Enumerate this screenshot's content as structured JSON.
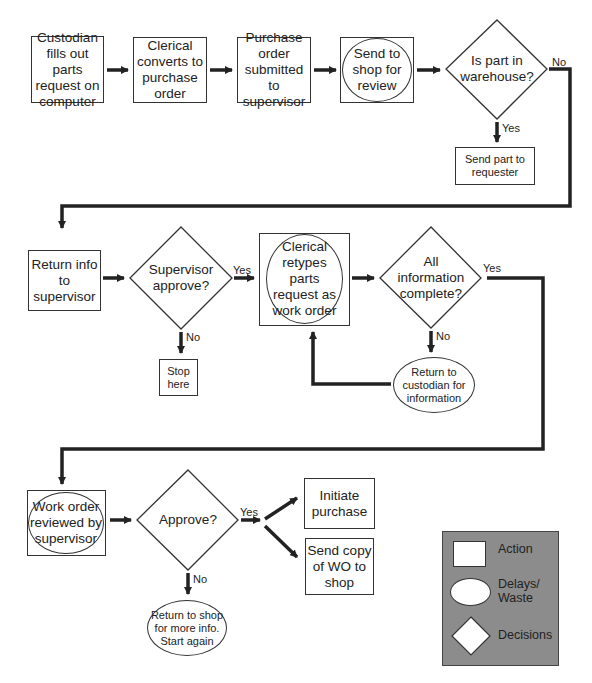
{
  "diagram": {
    "type": "flowchart",
    "nodes": {
      "custodian_fills": {
        "shape": "action",
        "label": "Custodian\nfills out parts\nrequest on\ncomputer"
      },
      "clerical_converts": {
        "shape": "action",
        "label": "Clerical\nconverts to\npurchase\norder"
      },
      "po_submitted": {
        "shape": "action",
        "label": "Purchase\norder\nsubmitted to\nsupervisor"
      },
      "send_to_shop": {
        "shape": "action-delay",
        "label": "Send to\nshop for\nreview"
      },
      "is_part_in_warehouse": {
        "shape": "decision",
        "label": "Is part in\nwarehouse?"
      },
      "send_part": {
        "shape": "action",
        "label": "Send part to\nrequester"
      },
      "return_info": {
        "shape": "action",
        "label": "Return info\nto\nsupervisor"
      },
      "supervisor_approve": {
        "shape": "decision",
        "label": "Supervisor\napprove?"
      },
      "stop_here": {
        "shape": "action",
        "label": "Stop\nhere"
      },
      "clerical_retypes": {
        "shape": "action-delay",
        "label": "Clerical\nretypes\nparts\nrequest as\nwork order"
      },
      "all_info_complete": {
        "shape": "decision",
        "label": "All\ninformation\ncomplete?"
      },
      "return_to_custodian": {
        "shape": "delay",
        "label": "Return to\ncustodian for\ninformation"
      },
      "wo_reviewed": {
        "shape": "action-delay",
        "label": "Work order\nreviewed by\nsupervisor"
      },
      "approve": {
        "shape": "decision",
        "label": "Approve?"
      },
      "initiate_purchase": {
        "shape": "action",
        "label": "Initiate\npurchase"
      },
      "send_copy": {
        "shape": "action",
        "label": "Send copy\nof WO to\nshop"
      },
      "return_to_shop": {
        "shape": "delay",
        "label": "Return to shop\nfor more info.\nStart again"
      }
    },
    "edge_labels": {
      "warehouse_no": "No",
      "warehouse_yes": "Yes",
      "supervisor_yes": "Yes",
      "supervisor_no": "No",
      "complete_yes": "Yes",
      "complete_no": "No",
      "approve_yes": "Yes",
      "approve_no": "No"
    },
    "edges": [
      [
        "custodian_fills",
        "clerical_converts",
        ""
      ],
      [
        "clerical_converts",
        "po_submitted",
        ""
      ],
      [
        "po_submitted",
        "send_to_shop",
        ""
      ],
      [
        "send_to_shop",
        "is_part_in_warehouse",
        ""
      ],
      [
        "is_part_in_warehouse",
        "send_part",
        "Yes"
      ],
      [
        "is_part_in_warehouse",
        "return_info",
        "No"
      ],
      [
        "return_info",
        "supervisor_approve",
        ""
      ],
      [
        "supervisor_approve",
        "clerical_retypes",
        "Yes"
      ],
      [
        "supervisor_approve",
        "stop_here",
        "No"
      ],
      [
        "clerical_retypes",
        "all_info_complete",
        ""
      ],
      [
        "all_info_complete",
        "return_to_custodian",
        "No"
      ],
      [
        "return_to_custodian",
        "clerical_retypes",
        ""
      ],
      [
        "all_info_complete",
        "wo_reviewed",
        "Yes"
      ],
      [
        "wo_reviewed",
        "approve",
        ""
      ],
      [
        "approve",
        "initiate_purchase",
        "Yes"
      ],
      [
        "approve",
        "send_copy",
        "Yes"
      ],
      [
        "approve",
        "return_to_shop",
        "No"
      ]
    ],
    "legend": {
      "action": "Action",
      "delays": "Delays/\nWaste",
      "decisions": "Decisions",
      "background_color": "#8c8c8c"
    }
  }
}
